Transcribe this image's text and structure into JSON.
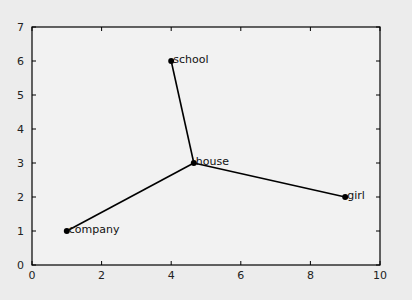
{
  "chart_data": {
    "type": "line",
    "title": "",
    "xlabel": "",
    "ylabel": "",
    "xlim": [
      0,
      10
    ],
    "ylim": [
      0,
      7
    ],
    "grid": false,
    "x_ticks": [
      "0",
      "2",
      "4",
      "6",
      "8",
      "10"
    ],
    "y_ticks": [
      "0",
      "1",
      "2",
      "3",
      "4",
      "5",
      "6",
      "7"
    ],
    "points": [
      {
        "label": "school",
        "x": 4.0,
        "y": 6.0
      },
      {
        "label": "house",
        "x": 4.65,
        "y": 3.0
      },
      {
        "label": "company",
        "x": 1.0,
        "y": 1.0
      },
      {
        "label": "girl",
        "x": 9.0,
        "y": 2.0
      }
    ],
    "edges": [
      [
        "house",
        "school"
      ],
      [
        "house",
        "company"
      ],
      [
        "house",
        "girl"
      ]
    ],
    "colors": {
      "line": "#000000",
      "marker": "#000000",
      "axes_bg": "#f2f2f2",
      "figure_bg": "#ececec"
    }
  }
}
